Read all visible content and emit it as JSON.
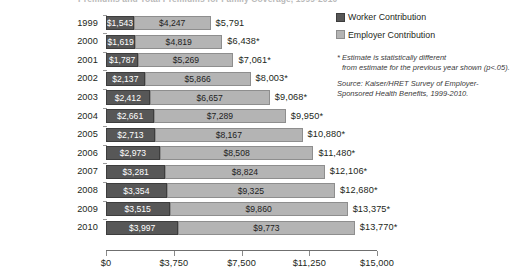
{
  "title": "Premiums and Total Premiums for Family Coverage, 1999-2010",
  "legend": {
    "items": [
      {
        "label": "Worker Contribution",
        "color": "#575757",
        "icon": "legend-swatch"
      },
      {
        "label": "Employer Contribution",
        "color": "#b4b4b4",
        "icon": "legend-swatch"
      }
    ]
  },
  "notes": {
    "footnote_line1": "* Estimate is statistically different",
    "footnote_line2": "from estimate for the previous year shown (p<.05).",
    "source_line1": "Source:  Kaiser/HRET Survey of Employer-",
    "source_line2": "Sponsored Health Benefits, 1999-2010."
  },
  "axis": {
    "ticks": [
      "$0",
      "$3,750",
      "$7,500",
      "$11,250",
      "$15,000"
    ],
    "tick_values": [
      0,
      3750,
      7500,
      11250,
      15000
    ],
    "min": 0,
    "max": 15000
  },
  "chart_data": {
    "type": "bar",
    "orientation": "horizontal",
    "stacked": true,
    "title": "Premiums and Total Premiums for Family Coverage, 1999-2010",
    "xlabel": "",
    "ylabel": "",
    "xlim": [
      0,
      15000
    ],
    "grid": false,
    "legend_position": "top-right",
    "categories": [
      "1999",
      "2000",
      "2001",
      "2002",
      "2003",
      "2004",
      "2005",
      "2006",
      "2007",
      "2008",
      "2009",
      "2010"
    ],
    "series": [
      {
        "name": "Worker Contribution",
        "color": "#575757",
        "values": [
          1543,
          1619,
          1787,
          2137,
          2412,
          2661,
          2713,
          2973,
          3281,
          3354,
          3515,
          3997
        ]
      },
      {
        "name": "Employer Contribution",
        "color": "#b4b4b4",
        "values": [
          4247,
          4819,
          5269,
          5866,
          6657,
          7289,
          8167,
          8508,
          8824,
          9325,
          9860,
          9773
        ]
      }
    ],
    "totals": [
      5791,
      6438,
      7061,
      8003,
      9068,
      9950,
      10880,
      11480,
      12106,
      12680,
      13375,
      13770
    ],
    "rows": [
      {
        "year": "1999",
        "worker_label": "$1,543",
        "employer_label": "$4,247",
        "total_label": "$5,791",
        "worker": 1543,
        "employer": 4247,
        "total": 5791,
        "significant": false
      },
      {
        "year": "2000",
        "worker_label": "$1,619",
        "employer_label": "$4,819",
        "total_label": "$6,438*",
        "worker": 1619,
        "employer": 4819,
        "total": 6438,
        "significant": true
      },
      {
        "year": "2001",
        "worker_label": "$1,787",
        "employer_label": "$5,269",
        "total_label": "$7,061*",
        "worker": 1787,
        "employer": 5269,
        "total": 7061,
        "significant": true
      },
      {
        "year": "2002",
        "worker_label": "$2,137",
        "employer_label": "$5,866",
        "total_label": "$8,003*",
        "worker": 2137,
        "employer": 5866,
        "total": 8003,
        "significant": true
      },
      {
        "year": "2003",
        "worker_label": "$2,412",
        "employer_label": "$6,657",
        "total_label": "$9,068*",
        "worker": 2412,
        "employer": 6657,
        "total": 9068,
        "significant": true
      },
      {
        "year": "2004",
        "worker_label": "$2,661",
        "employer_label": "$7,289",
        "total_label": "$9,950*",
        "worker": 2661,
        "employer": 7289,
        "total": 9950,
        "significant": true
      },
      {
        "year": "2005",
        "worker_label": "$2,713",
        "employer_label": "$8,167",
        "total_label": "$10,880*",
        "worker": 2713,
        "employer": 8167,
        "total": 10880,
        "significant": true
      },
      {
        "year": "2006",
        "worker_label": "$2,973",
        "employer_label": "$8,508",
        "total_label": "$11,480*",
        "worker": 2973,
        "employer": 8508,
        "total": 11480,
        "significant": true
      },
      {
        "year": "2007",
        "worker_label": "$3,281",
        "employer_label": "$8,824",
        "total_label": "$12,106*",
        "worker": 3281,
        "employer": 8824,
        "total": 12106,
        "significant": true
      },
      {
        "year": "2008",
        "worker_label": "$3,354",
        "employer_label": "$9,325",
        "total_label": "$12,680*",
        "worker": 3354,
        "employer": 9325,
        "total": 12680,
        "significant": true
      },
      {
        "year": "2009",
        "worker_label": "$3,515",
        "employer_label": "$9,860",
        "total_label": "$13,375*",
        "worker": 3515,
        "employer": 9860,
        "total": 13375,
        "significant": true
      },
      {
        "year": "2010",
        "worker_label": "$3,997",
        "employer_label": "$9,773",
        "total_label": "$13,770*",
        "worker": 3997,
        "employer": 9773,
        "total": 13770,
        "significant": true
      }
    ]
  }
}
